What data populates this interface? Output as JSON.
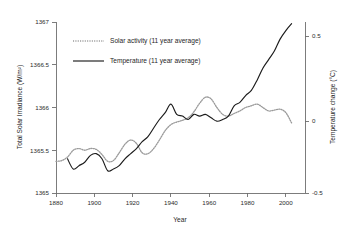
{
  "chart_data": {
    "type": "line",
    "title": "",
    "xlabel": "Year",
    "ylabel": "Total Solar Irradiance (W/m²)",
    "y2label": "Temperature change (°C)",
    "xlim": [
      1880,
      2010
    ],
    "ylim": [
      1365,
      1367
    ],
    "y2lim": [
      -0.5,
      0.5
    ],
    "grid": false,
    "legend_position": "upper-left-inside",
    "xticks": [
      1880,
      1900,
      1920,
      1940,
      1960,
      1980,
      2000
    ],
    "xtick_labels": [
      "1880",
      "1900",
      "1920",
      "1940",
      "1960",
      "1980",
      "2000"
    ],
    "yticks": [
      1365,
      1365.5,
      1366,
      1366.5,
      1367
    ],
    "ytick_labels": [
      "1365",
      "1365.5",
      "1366",
      "1366.5",
      "1367"
    ],
    "y2ticks": [
      -0.5,
      0,
      0.5
    ],
    "y2tick_labels": [
      "-0.5",
      "0",
      "0.5"
    ],
    "series": [
      {
        "name": "Solar activity (11 year average)",
        "axis": "left",
        "units": "W/m^2",
        "style": "dotted",
        "color": "#9a9a9a",
        "x": [
          1880,
          1883,
          1886,
          1889,
          1892,
          1895,
          1898,
          1901,
          1904,
          1907,
          1910,
          1913,
          1916,
          1919,
          1922,
          1925,
          1928,
          1931,
          1934,
          1937,
          1940,
          1943,
          1946,
          1949,
          1952,
          1955,
          1958,
          1961,
          1964,
          1967,
          1970,
          1973,
          1976,
          1979,
          1982,
          1985,
          1988,
          1991,
          1994,
          1997,
          2000,
          2003
        ],
        "y": [
          1365.37,
          1365.38,
          1365.42,
          1365.5,
          1365.52,
          1365.5,
          1365.52,
          1365.51,
          1365.45,
          1365.37,
          1365.38,
          1365.47,
          1365.57,
          1365.62,
          1365.58,
          1365.47,
          1365.46,
          1365.52,
          1365.62,
          1365.73,
          1365.8,
          1365.83,
          1365.85,
          1365.88,
          1365.95,
          1366.05,
          1366.12,
          1366.1,
          1366.0,
          1365.92,
          1365.9,
          1365.93,
          1365.96,
          1366.0,
          1366.02,
          1366.04,
          1366.0,
          1365.96,
          1365.97,
          1365.98,
          1365.94,
          1365.82
        ]
      },
      {
        "name": "Temperature (11 year average)",
        "axis": "right",
        "units": "degC",
        "style": "solid",
        "color": "#1b1b1b",
        "x": [
          1886,
          1889,
          1892,
          1895,
          1898,
          1901,
          1904,
          1907,
          1910,
          1913,
          1916,
          1919,
          1922,
          1925,
          1928,
          1931,
          1934,
          1937,
          1940,
          1943,
          1946,
          1949,
          1952,
          1955,
          1958,
          1961,
          1964,
          1967,
          1970,
          1973,
          1976,
          1979,
          1982,
          1985,
          1988,
          1991,
          1994,
          1997,
          2000,
          2003
        ],
        "y": [
          -0.3,
          -0.36,
          -0.34,
          -0.32,
          -0.28,
          -0.27,
          -0.3,
          -0.37,
          -0.36,
          -0.34,
          -0.3,
          -0.27,
          -0.24,
          -0.2,
          -0.17,
          -0.12,
          -0.07,
          -0.03,
          0.02,
          -0.04,
          -0.05,
          -0.07,
          -0.04,
          -0.05,
          -0.04,
          -0.06,
          -0.08,
          -0.07,
          -0.05,
          0.01,
          0.03,
          0.07,
          0.1,
          0.16,
          0.23,
          0.28,
          0.33,
          0.4,
          0.45,
          0.49
        ]
      }
    ]
  },
  "legend": {
    "items": [
      {
        "label": "Solar activity (11 year average)",
        "style": "dotted",
        "color": "#9a9a9a"
      },
      {
        "label": "Temperature (11 year average)",
        "style": "solid",
        "color": "#1b1b1b"
      }
    ]
  },
  "axes": {
    "left_title": "Total Solar Irradiance (W/m²)",
    "right_title": "Temperature change (°C)",
    "bottom_title": "Year"
  }
}
